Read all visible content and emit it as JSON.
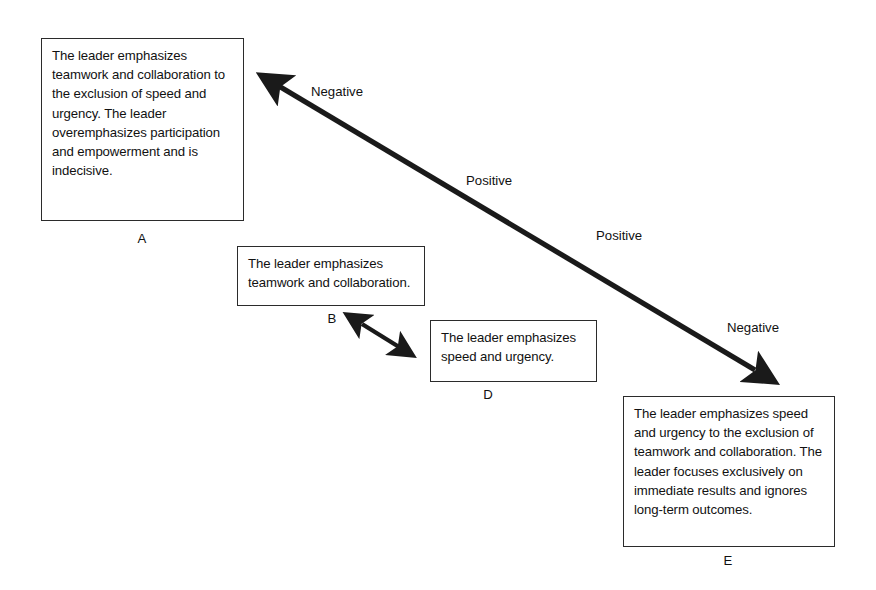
{
  "diagram": {
    "background_color": "#ffffff",
    "line_color": "#1a1a1a",
    "text_color": "#111111",
    "boxes": [
      {
        "id": "A",
        "label": "A",
        "text": "The leader emphasizes teamwork and collaboration to the exclusion of speed and urgency.  The leader overemphasizes participation and empowerment and is indecisive."
      },
      {
        "id": "B",
        "label": "B",
        "text": "The leader emphasizes teamwork and collaboration."
      },
      {
        "id": "D",
        "label": "D",
        "text": "The leader emphasizes speed and urgency."
      },
      {
        "id": "E",
        "label": "E",
        "text": "The leader emphasizes speed and urgency to the exclusion of teamwork and collaboration.  The leader focuses exclusively on immediate results and ignores long-term outcomes."
      }
    ],
    "edge_labels": [
      {
        "id": "negative-top",
        "text": "Negative"
      },
      {
        "id": "positive-mid",
        "text": "Positive"
      },
      {
        "id": "positive-lower",
        "text": "Positive"
      },
      {
        "id": "negative-bottom",
        "text": "Negative"
      }
    ],
    "arrows": [
      {
        "id": "main-diagonal",
        "kind": "double-headed-diagonal",
        "from": [
          258,
          72
        ],
        "to": [
          755,
          370
        ]
      },
      {
        "id": "b-d-connector",
        "kind": "double-headed-short",
        "from": [
          360,
          322
        ],
        "to": [
          414,
          357
        ]
      }
    ]
  }
}
